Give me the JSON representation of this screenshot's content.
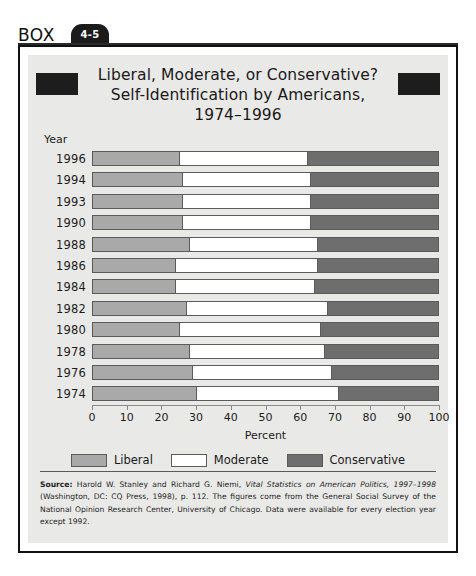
{
  "box": {
    "word": "BOX",
    "number": "4-5"
  },
  "chart_data": {
    "type": "bar",
    "orientation": "horizontal",
    "stacked": true,
    "stack_total": 100,
    "title": "Liberal, Moderate, or Conservative? Self-Identification by Americans, 1974–1996",
    "title_lines": [
      "Liberal, Moderate, or Conservative?",
      "Self-Identification by Americans,",
      "1974–1996"
    ],
    "xlabel": "Percent",
    "ylabel": "Year",
    "xlim": [
      0,
      100
    ],
    "xticks": [
      0,
      10,
      20,
      30,
      40,
      50,
      60,
      70,
      80,
      90,
      100
    ],
    "xtick_labels": [
      "0",
      "10",
      "20",
      "30",
      "40",
      "50",
      "60",
      "70",
      "80",
      "90",
      "100"
    ],
    "grid": false,
    "legend_position": "bottom",
    "categories": [
      "1996",
      "1994",
      "1993",
      "1990",
      "1988",
      "1986",
      "1984",
      "1982",
      "1980",
      "1978",
      "1976",
      "1974"
    ],
    "series": [
      {
        "name": "Liberal",
        "color": "#a9a9a9",
        "values": [
          25,
          26,
          26,
          26,
          28,
          24,
          24,
          27,
          25,
          28,
          29,
          30
        ]
      },
      {
        "name": "Moderate",
        "color": "#ffffff",
        "values": [
          37,
          37,
          37,
          37,
          37,
          41,
          40,
          41,
          41,
          39,
          40,
          41
        ]
      },
      {
        "name": "Conservative",
        "color": "#6e6e6e",
        "values": [
          38,
          37,
          37,
          37,
          35,
          35,
          36,
          32,
          34,
          33,
          31,
          29
        ]
      }
    ],
    "rows": [
      {
        "year": "1996",
        "liberal": 25,
        "moderate": 37,
        "conservative": 38
      },
      {
        "year": "1994",
        "liberal": 26,
        "moderate": 37,
        "conservative": 37
      },
      {
        "year": "1993",
        "liberal": 26,
        "moderate": 37,
        "conservative": 37
      },
      {
        "year": "1990",
        "liberal": 26,
        "moderate": 37,
        "conservative": 37
      },
      {
        "year": "1988",
        "liberal": 28,
        "moderate": 37,
        "conservative": 35
      },
      {
        "year": "1986",
        "liberal": 24,
        "moderate": 41,
        "conservative": 35
      },
      {
        "year": "1984",
        "liberal": 24,
        "moderate": 40,
        "conservative": 36
      },
      {
        "year": "1982",
        "liberal": 27,
        "moderate": 41,
        "conservative": 32
      },
      {
        "year": "1980",
        "liberal": 25,
        "moderate": 41,
        "conservative": 34
      },
      {
        "year": "1978",
        "liberal": 28,
        "moderate": 39,
        "conservative": 33
      },
      {
        "year": "1976",
        "liberal": 29,
        "moderate": 40,
        "conservative": 31
      },
      {
        "year": "1974",
        "liberal": 30,
        "moderate": 41,
        "conservative": 29
      }
    ],
    "legend": [
      {
        "label": "Liberal",
        "color": "#a9a9a9"
      },
      {
        "label": "Moderate",
        "color": "#ffffff"
      },
      {
        "label": "Conservative",
        "color": "#6e6e6e"
      }
    ]
  },
  "source": {
    "label": "Source:",
    "text": " Harold W. Stanley and Richard G. Niemi, ",
    "italic_title": "Vital Statistics on American Politics, 1997–1998",
    "rest": " (Washington, DC: CQ Press, 1998), p. 112. The figures come from the General Social Survey of the National Opinion Research Center, University of Chicago. Data were available for every election year except 1992."
  }
}
